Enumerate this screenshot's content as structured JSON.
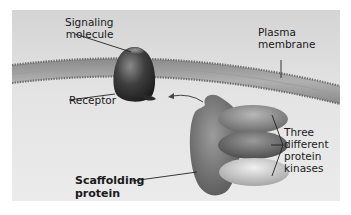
{
  "figure": {
    "type": "biology-diagram",
    "colors": {
      "panel_top": "#d6d6d6",
      "panel_bottom": "#ececec",
      "membrane_outer": "#8c8c8c",
      "membrane_inner": "#a8a8a8",
      "receptor": "#3a3a3a",
      "scaffold": "#6e6e6e",
      "kinase_top": "#8a8a8a",
      "kinase_middle": "#6a6a6a",
      "kinase_bottom": "#c4c4c4",
      "label_text": "#1a1a1a"
    }
  },
  "labels": {
    "signaling_molecule": [
      "Signaling",
      "molecule"
    ],
    "plasma_membrane": [
      "Plasma",
      "membrane"
    ],
    "receptor": "Receptor",
    "scaffolding_protein": [
      "Scaffolding",
      "protein"
    ],
    "kinases": [
      "Three",
      "different",
      "protein",
      "kinases"
    ]
  }
}
